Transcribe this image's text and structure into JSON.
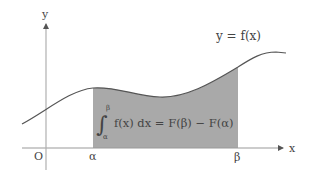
{
  "diagram": {
    "curve_label": "y = f(x)",
    "formula": {
      "integral_sign": "∫",
      "upper_limit": "β",
      "lower_limit": "α",
      "integrand": "f(x) dx = F(β) − F(α)"
    },
    "axes": {
      "x_label": "x",
      "y_label": "y",
      "origin_label": "O"
    },
    "ticks": {
      "alpha": "α",
      "beta": "β"
    },
    "colors": {
      "curve": "#555555",
      "shade": "#a9a9a9",
      "axis": "#9a9a9a",
      "text": "#444444"
    }
  }
}
